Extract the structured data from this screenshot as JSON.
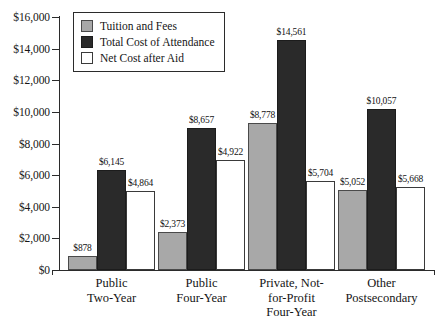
{
  "chart_data": {
    "type": "bar",
    "title": "",
    "subtitle": "",
    "xlabel": "",
    "ylabel": "",
    "ylim": [
      0,
      16000
    ],
    "ytick_step": 2000,
    "grid": false,
    "legend_position": "top-left-inside",
    "currency_prefix": "$",
    "categories": [
      "Public\nTwo-Year",
      "Public\nFour-Year",
      "Private, Not-\nfor-Profit\nFour-Year",
      "Other\nPostsecondary"
    ],
    "ytick_labels": [
      "$0",
      "$2,000",
      "$4,000",
      "$6,000",
      "$8,000",
      "$10,000",
      "$12,000",
      "$14,000",
      "$16,000"
    ],
    "ytick_values": [
      0,
      2000,
      4000,
      6000,
      8000,
      10000,
      12000,
      14000,
      16000
    ],
    "series": [
      {
        "name": "Tuition and Fees",
        "color": "#a8a8a8",
        "values": [
          878,
          2373,
          8778,
          5052
        ],
        "labels": [
          "$878",
          "$2,373",
          "$8,778",
          "$5,052"
        ],
        "drawn_values": [
          878,
          2373,
          9270,
          5052
        ]
      },
      {
        "name": "Total Cost of Attendance",
        "color": "#2a2a2a",
        "values": [
          6145,
          8657,
          14561,
          10057
        ],
        "labels": [
          "$6,145",
          "$8,657",
          "$14,561",
          "$10,057"
        ],
        "drawn_values": [
          6300,
          9010,
          14561,
          10170
        ]
      },
      {
        "name": "Net Cost after Aid",
        "color": "#ffffff",
        "values": [
          4864,
          4922,
          5704,
          5668
        ],
        "labels": [
          "$4,864",
          "$4,922",
          "$5,704",
          "$5,668"
        ],
        "drawn_values": [
          4980,
          6950,
          5600,
          5250
        ]
      }
    ]
  }
}
